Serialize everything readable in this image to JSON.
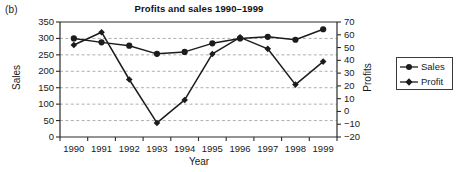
{
  "panel": {
    "letter": "(b)"
  },
  "chart_data": {
    "type": "line",
    "title": "Profits and sales 1990–1999",
    "xlabel": "Year",
    "ylabel": "Sales",
    "y2label": "Profits",
    "categories": [
      "1990",
      "1991",
      "1992",
      "1993",
      "1994",
      "1995",
      "1996",
      "1997",
      "1998",
      "1999"
    ],
    "x": [
      1990,
      1991,
      1992,
      1993,
      1994,
      1995,
      1996,
      1997,
      1998,
      1999
    ],
    "series": [
      {
        "name": "Sales",
        "axis": "left",
        "marker": "circle",
        "color": "#1c1c1c",
        "values": [
          300,
          288,
          278,
          253,
          259,
          285,
          300,
          305,
          296,
          328
        ]
      },
      {
        "name": "Profit",
        "axis": "right",
        "marker": "diamond",
        "color": "#1c1c1c",
        "values": [
          52,
          62,
          25,
          -9,
          9,
          45,
          58,
          49,
          21,
          39
        ]
      }
    ],
    "ylim": [
      0,
      350
    ],
    "yticks": [
      "0",
      "50",
      "100",
      "150",
      "200",
      "250",
      "300",
      "350"
    ],
    "y2lim": [
      -20,
      70
    ],
    "y2ticks": [
      "-20",
      "-10",
      "0",
      "10",
      "20",
      "30",
      "40",
      "50",
      "60",
      "70"
    ],
    "grid": true,
    "grid_axis": "y",
    "legend_position": "right",
    "legend": [
      "Sales",
      "Profit"
    ]
  }
}
